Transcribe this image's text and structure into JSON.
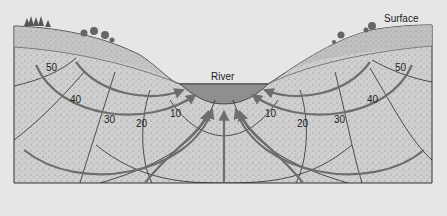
{
  "labels": {
    "surface": "Surface",
    "river": "River"
  },
  "equipotentials_left": [
    "50",
    "40",
    "30",
    "20",
    "10"
  ],
  "equipotentials_right": [
    "10",
    "20",
    "30",
    "40",
    "50"
  ],
  "colors": {
    "background": "#e6e6e6",
    "soil": "#cfcfcf",
    "topsoil": "#bdbdbd",
    "river": "#8f8f8f",
    "flow_line": "#6e6e6e",
    "equipotential": "#2a2a2a",
    "outline": "#333333"
  }
}
